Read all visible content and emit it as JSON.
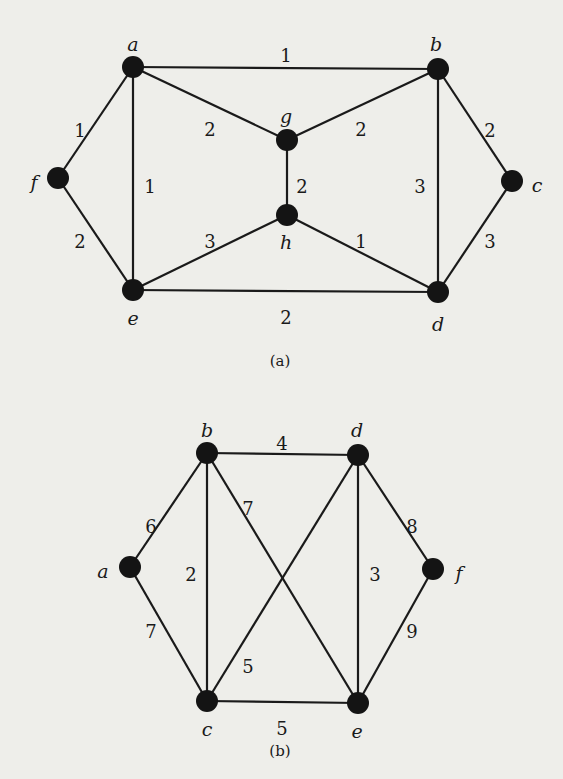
{
  "figures": [
    {
      "id": "a",
      "caption": "(a)",
      "caption_pos": [
        280,
        362
      ],
      "vertices": [
        {
          "name": "a",
          "x": 133,
          "y": 67,
          "lx": 133,
          "ly": 46
        },
        {
          "name": "b",
          "x": 438,
          "y": 69,
          "lx": 436,
          "ly": 46
        },
        {
          "name": "g",
          "x": 287,
          "y": 140,
          "lx": 286,
          "ly": 118
        },
        {
          "name": "f",
          "x": 58,
          "y": 178,
          "lx": 34,
          "ly": 184
        },
        {
          "name": "c",
          "x": 512,
          "y": 181,
          "lx": 537,
          "ly": 187
        },
        {
          "name": "h",
          "x": 287,
          "y": 215,
          "lx": 286,
          "ly": 244
        },
        {
          "name": "e",
          "x": 133,
          "y": 290,
          "lx": 133,
          "ly": 320
        },
        {
          "name": "d",
          "x": 438,
          "y": 292,
          "lx": 438,
          "ly": 326
        }
      ],
      "edges": [
        {
          "from": "a",
          "to": "b",
          "weight": "1",
          "lx": 286,
          "ly": 57
        },
        {
          "from": "a",
          "to": "g",
          "weight": "2",
          "lx": 210,
          "ly": 131
        },
        {
          "from": "b",
          "to": "g",
          "weight": "2",
          "lx": 361,
          "ly": 131
        },
        {
          "from": "a",
          "to": "f",
          "weight": "1",
          "lx": 80,
          "ly": 132
        },
        {
          "from": "a",
          "to": "e",
          "weight": "1",
          "lx": 150,
          "ly": 188
        },
        {
          "from": "g",
          "to": "h",
          "weight": "2",
          "lx": 302,
          "ly": 188
        },
        {
          "from": "b",
          "to": "d",
          "weight": "3",
          "lx": 420,
          "ly": 188
        },
        {
          "from": "b",
          "to": "c",
          "weight": "2",
          "lx": 490,
          "ly": 132
        },
        {
          "from": "f",
          "to": "e",
          "weight": "2",
          "lx": 80,
          "ly": 243
        },
        {
          "from": "e",
          "to": "h",
          "weight": "3",
          "lx": 210,
          "ly": 243
        },
        {
          "from": "h",
          "to": "d",
          "weight": "1",
          "lx": 361,
          "ly": 243
        },
        {
          "from": "c",
          "to": "d",
          "weight": "3",
          "lx": 490,
          "ly": 243
        },
        {
          "from": "e",
          "to": "d",
          "weight": "2",
          "lx": 286,
          "ly": 319
        }
      ]
    },
    {
      "id": "b",
      "caption": "(b)",
      "caption_pos": [
        280,
        752
      ],
      "vertices": [
        {
          "name": "b",
          "x": 207,
          "y": 453,
          "lx": 207,
          "ly": 432
        },
        {
          "name": "d",
          "x": 358,
          "y": 455,
          "lx": 357,
          "ly": 432
        },
        {
          "name": "a",
          "x": 130,
          "y": 567,
          "lx": 103,
          "ly": 573
        },
        {
          "name": "f",
          "x": 433,
          "y": 569,
          "lx": 459,
          "ly": 575
        },
        {
          "name": "c",
          "x": 207,
          "y": 701,
          "lx": 207,
          "ly": 731
        },
        {
          "name": "e",
          "x": 358,
          "y": 703,
          "lx": 357,
          "ly": 733
        }
      ],
      "edges": [
        {
          "from": "b",
          "to": "d",
          "weight": "4",
          "lx": 282,
          "ly": 445
        },
        {
          "from": "a",
          "to": "b",
          "weight": "6",
          "lx": 151,
          "ly": 528
        },
        {
          "from": "b",
          "to": "c",
          "weight": "2",
          "lx": 191,
          "ly": 576
        },
        {
          "from": "b",
          "to": "e",
          "weight": "7",
          "lx": 248,
          "ly": 510
        },
        {
          "from": "d",
          "to": "c",
          "weight": "5",
          "lx": 248,
          "ly": 668
        },
        {
          "from": "d",
          "to": "e",
          "weight": "3",
          "lx": 375,
          "ly": 576
        },
        {
          "from": "d",
          "to": "f",
          "weight": "8",
          "lx": 412,
          "ly": 528
        },
        {
          "from": "a",
          "to": "c",
          "weight": "7",
          "lx": 151,
          "ly": 633
        },
        {
          "from": "e",
          "to": "f",
          "weight": "9",
          "lx": 412,
          "ly": 633
        },
        {
          "from": "c",
          "to": "e",
          "weight": "5",
          "lx": 282,
          "ly": 730
        }
      ]
    }
  ]
}
